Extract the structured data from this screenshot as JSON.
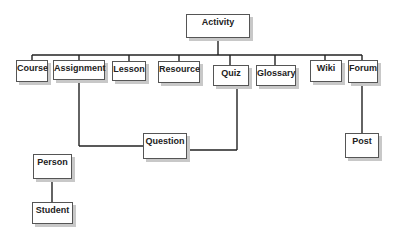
{
  "diagram": {
    "type": "hierarchy",
    "root": "Activity",
    "nodes": {
      "activity": "Activity",
      "course": "Course",
      "assignment": "Assignment",
      "lesson": "Lesson",
      "resource": "Resource",
      "quiz": "Quiz",
      "glossary": "Glossary",
      "wiki": "Wiki",
      "forum": "Forum",
      "question": "Question",
      "post": "Post",
      "person": "Person",
      "student": "Student"
    },
    "edges": [
      [
        "Activity",
        "Course"
      ],
      [
        "Activity",
        "Assignment"
      ],
      [
        "Activity",
        "Lesson"
      ],
      [
        "Activity",
        "Resource"
      ],
      [
        "Activity",
        "Quiz"
      ],
      [
        "Activity",
        "Glossary"
      ],
      [
        "Activity",
        "Wiki"
      ],
      [
        "Activity",
        "Forum"
      ],
      [
        "Assignment",
        "Question"
      ],
      [
        "Quiz",
        "Question"
      ],
      [
        "Forum",
        "Post"
      ],
      [
        "Person",
        "Student"
      ]
    ]
  }
}
